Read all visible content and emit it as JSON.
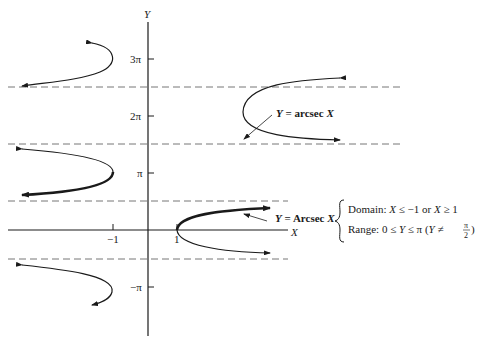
{
  "axes": {
    "x_label": "X",
    "y_label": "Y",
    "x_ticks": [
      {
        "label": "−1",
        "value": -1
      },
      {
        "label": "1",
        "value": 1
      }
    ],
    "y_ticks": [
      {
        "label": "3π",
        "value": "3π"
      },
      {
        "label": "2π",
        "value": "2π"
      },
      {
        "label": "π",
        "value": "π"
      },
      {
        "label": "−π",
        "value": "−π"
      }
    ],
    "asymptotes": [
      "5π/2",
      "3π/2",
      "π/2",
      "−π/2"
    ]
  },
  "annotations": {
    "general": {
      "y": "Y",
      "eq": " = arcsec ",
      "x": "X"
    },
    "principal": {
      "y": "Y",
      "eq": " = Arcsec ",
      "x": "X"
    },
    "domain": {
      "prefix": "Domain: ",
      "x1": "X",
      "rel1": " ≤ −1 or ",
      "x2": "X",
      "rel2": " ≥ 1"
    },
    "range": {
      "prefix": "Range: 0 ≤ ",
      "y": "Y",
      "rel": " ≤ π (",
      "y2": "Y",
      "ne": " ≠ ",
      "frac_num": "π",
      "frac_den": "2",
      "close": ")"
    }
  },
  "colors": {
    "curve": "#1a1a1a",
    "axis": "#1a1a1a",
    "dashed": "#777777"
  }
}
